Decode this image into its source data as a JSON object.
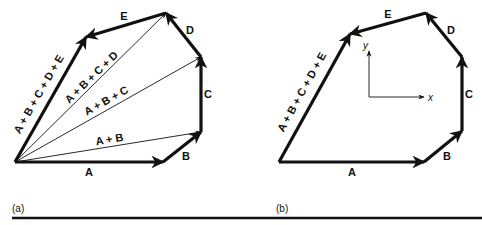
{
  "figure": {
    "ink_color": "#111111",
    "background": "#ffffff",
    "panels": [
      {
        "id": "a",
        "caption": "(a)",
        "caption_pos": [
          12,
          212
        ],
        "origin": [
          15,
          162
        ],
        "vectors": [
          {
            "label": "A",
            "from": [
              15,
              162
            ],
            "to": [
              163,
              162
            ],
            "weight": "thick",
            "label_pos": [
              89,
              176
            ],
            "label_rot": 0
          },
          {
            "label": "B",
            "from": [
              163,
              162
            ],
            "to": [
              201,
              132
            ],
            "weight": "thick",
            "label_pos": [
              186,
              160
            ],
            "label_rot": 0
          },
          {
            "label": "C",
            "from": [
              201,
              132
            ],
            "to": [
              201,
              57
            ],
            "weight": "thick",
            "label_pos": [
              208,
              98
            ],
            "label_rot": 0
          },
          {
            "label": "D",
            "from": [
              201,
              57
            ],
            "to": [
              166,
              13
            ],
            "weight": "thick",
            "label_pos": [
              190,
              34
            ],
            "label_rot": 0
          },
          {
            "label": "E",
            "from": [
              166,
              13
            ],
            "to": [
              86,
              37
            ],
            "weight": "thick",
            "label_pos": [
              124,
              20
            ],
            "label_rot": 0
          }
        ],
        "resultants": [
          {
            "label": "A + B",
            "from": [
              15,
              162
            ],
            "to": [
              201,
              132
            ],
            "weight": "thin",
            "label_pos": [
              110,
              143
            ],
            "label_rot": -9
          },
          {
            "label": "A + B + C",
            "from": [
              15,
              162
            ],
            "to": [
              201,
              57
            ],
            "weight": "thin",
            "label_pos": [
              108,
              104
            ],
            "label_rot": -29
          },
          {
            "label": "A + B + C + D",
            "from": [
              15,
              162
            ],
            "to": [
              166,
              13
            ],
            "weight": "thin",
            "label_pos": [
              94,
              80
            ],
            "label_rot": -44
          },
          {
            "label": "A + B + C + D + E",
            "from": [
              15,
              162
            ],
            "to": [
              86,
              37
            ],
            "weight": "thick",
            "label_pos": [
              42,
              96
            ],
            "label_rot": -60
          }
        ]
      },
      {
        "id": "b",
        "caption": "(b)",
        "caption_pos": [
          276,
          212
        ],
        "origin": [
          279,
          162
        ],
        "vectors": [
          {
            "label": "A",
            "from": [
              279,
              162
            ],
            "to": [
              424,
              162
            ],
            "weight": "thick",
            "label_pos": [
              352,
              176
            ],
            "label_rot": 0
          },
          {
            "label": "B",
            "from": [
              424,
              162
            ],
            "to": [
              462,
              131
            ],
            "weight": "thick",
            "label_pos": [
              447,
              160
            ],
            "label_rot": 0
          },
          {
            "label": "C",
            "from": [
              462,
              131
            ],
            "to": [
              462,
              57
            ],
            "weight": "thick",
            "label_pos": [
              469,
              98
            ],
            "label_rot": 0
          },
          {
            "label": "D",
            "from": [
              462,
              57
            ],
            "to": [
              426,
              13
            ],
            "weight": "thick",
            "label_pos": [
              451,
              34
            ],
            "label_rot": 0
          },
          {
            "label": "E",
            "from": [
              426,
              13
            ],
            "to": [
              350,
              34
            ],
            "weight": "thick",
            "label_pos": [
              388,
              18
            ],
            "label_rot": 0
          }
        ],
        "resultants": [
          {
            "label": "A + B + C + D + E",
            "from": [
              279,
              162
            ],
            "to": [
              350,
              34
            ],
            "weight": "thick",
            "label_pos": [
              305,
              94
            ],
            "label_rot": -61
          }
        ],
        "axes": {
          "origin": [
            369,
            97
          ],
          "x_tip": [
            424,
            97
          ],
          "y_tip": [
            369,
            51
          ],
          "x_label": "x",
          "y_label": "y",
          "x_label_pos": [
            428,
            101
          ],
          "y_label_pos": [
            363,
            49
          ]
        }
      }
    ],
    "rule": {
      "y": 218,
      "x1": 12,
      "x2": 482
    }
  }
}
